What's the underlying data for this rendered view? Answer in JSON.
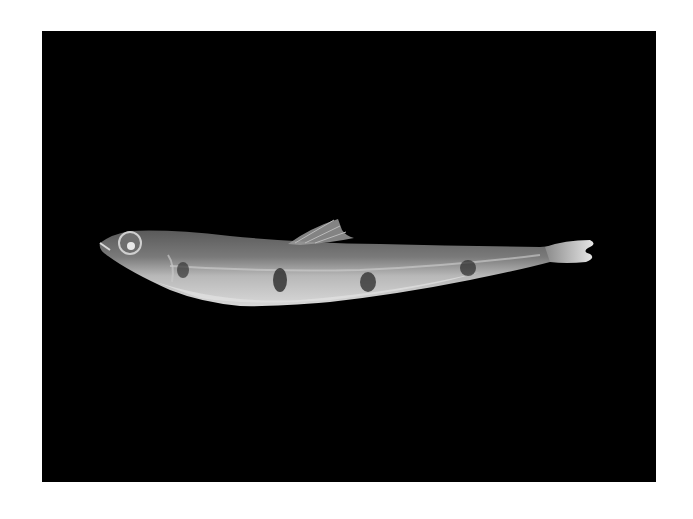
{
  "photo": {
    "subject": "Preserved fish specimen, lateral view",
    "background_color": "#000000",
    "border_color": "#ffffff",
    "orientation": "head-left"
  }
}
